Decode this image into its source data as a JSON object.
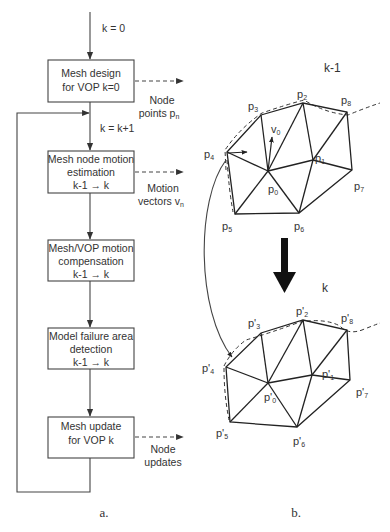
{
  "flowchart": {
    "caption": "a.",
    "start_label": "k = 0",
    "increment_label": "k = k+1",
    "boxes": [
      {
        "line1": "Mesh design",
        "line2": "for VOP k=0",
        "line3": ""
      },
      {
        "line1": "Mesh node motion",
        "line2": "estimation",
        "line3": "k-1 → k"
      },
      {
        "line1": "Mesh/VOP motion",
        "line2": "compensation",
        "line3": "k-1 → k"
      },
      {
        "line1": "Model failure area",
        "line2": "detection",
        "line3": "k-1 → k"
      },
      {
        "line1": "Mesh update",
        "line2": "for VOP k",
        "line3": ""
      }
    ],
    "outputs": [
      {
        "line1": "Node",
        "line2": "points p",
        "sub": "n"
      },
      {
        "line1": "Motion",
        "line2": "vectors v",
        "sub": "n"
      },
      {
        "line1": "Node",
        "line2": "updates",
        "sub": ""
      }
    ]
  },
  "mesh": {
    "caption": "b.",
    "frame_prev_label": "k-1",
    "frame_curr_label": "k",
    "motion_vector_label": "v",
    "motion_vector_sub": "0",
    "prev_nodes": [
      {
        "name": "p",
        "sub": "0",
        "x": 268,
        "y": 171
      },
      {
        "name": "p",
        "sub": "1",
        "x": 313,
        "y": 160
      },
      {
        "name": "p",
        "sub": "2",
        "x": 303,
        "y": 103
      },
      {
        "name": "p",
        "sub": "3",
        "x": 261,
        "y": 115
      },
      {
        "name": "p",
        "sub": "4",
        "x": 227,
        "y": 152
      },
      {
        "name": "p",
        "sub": "5",
        "x": 235,
        "y": 214
      },
      {
        "name": "p",
        "sub": "6",
        "x": 299,
        "y": 213
      },
      {
        "name": "p",
        "sub": "7",
        "x": 352,
        "y": 170
      },
      {
        "name": "p",
        "sub": "8",
        "x": 347,
        "y": 112
      }
    ],
    "curr_nodes": [
      {
        "name": "p'",
        "sub": "0",
        "x": 268,
        "y": 383
      },
      {
        "name": "p'",
        "sub": "1",
        "x": 312,
        "y": 375
      },
      {
        "name": "p'",
        "sub": "2",
        "x": 303,
        "y": 320
      },
      {
        "name": "p'",
        "sub": "3",
        "x": 261,
        "y": 333
      },
      {
        "name": "p'",
        "sub": "4",
        "x": 226,
        "y": 367
      },
      {
        "name": "p'",
        "sub": "5",
        "x": 230,
        "y": 422
      },
      {
        "name": "p'",
        "sub": "6",
        "x": 297,
        "y": 427
      },
      {
        "name": "p'",
        "sub": "7",
        "x": 350,
        "y": 380
      },
      {
        "name": "p'",
        "sub": "8",
        "x": 347,
        "y": 330
      }
    ]
  }
}
